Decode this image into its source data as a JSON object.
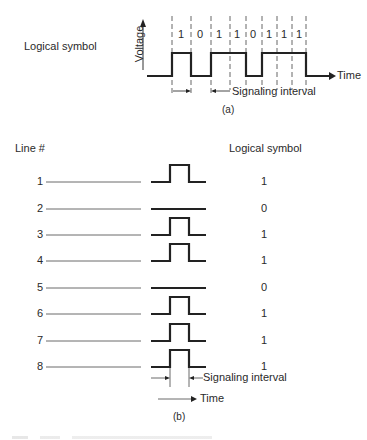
{
  "part_a": {
    "left_label": "Logical symbol",
    "y_axis_label": "Voltage",
    "x_axis_label": "Time",
    "bits": [
      "1",
      "0",
      "1",
      "1",
      "0",
      "1",
      "1",
      "1"
    ],
    "interval_label": "Signaling interval",
    "caption": "(a)"
  },
  "part_b": {
    "header_left": "Line #",
    "header_right": "Logical symbol",
    "lines": [
      {
        "number": "1",
        "symbol": "1"
      },
      {
        "number": "2",
        "symbol": "0"
      },
      {
        "number": "3",
        "symbol": "1"
      },
      {
        "number": "4",
        "symbol": "1"
      },
      {
        "number": "5",
        "symbol": "0"
      },
      {
        "number": "6",
        "symbol": "1"
      },
      {
        "number": "7",
        "symbol": "1"
      },
      {
        "number": "8",
        "symbol": "1"
      }
    ],
    "interval_label": "Signaling interval",
    "time_label": "Time",
    "caption": "(b)"
  }
}
